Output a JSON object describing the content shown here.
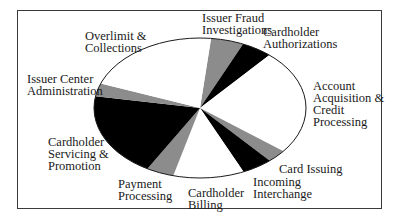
{
  "chart_data": {
    "type": "pie",
    "title": "",
    "style": "elliptical pie, monochrome fills (white / gray / black)",
    "start_angle_deg_clockwise_from_top": 6,
    "slices": [
      {
        "label": "Issuer Fraud Investigations",
        "value": 5.0,
        "fill": "#8c8c8c"
      },
      {
        "label": "Cardholder Authorizations",
        "value": 4.7,
        "fill": "#000000"
      },
      {
        "label": "Account Acquisition & Credit Processing",
        "value": 24.2,
        "fill": "#ffffff"
      },
      {
        "label": "Card Issuing",
        "value": 3.0,
        "fill": "#8c8c8c"
      },
      {
        "label": "Incoming Interchange",
        "value": 4.7,
        "fill": "#000000"
      },
      {
        "label": "Cardholder Billing",
        "value": 10.8,
        "fill": "#ffffff"
      },
      {
        "label": "Payment Processing",
        "value": 4.2,
        "fill": "#8c8c8c"
      },
      {
        "label": "Cardholder Servicing & Promotion",
        "value": 19.4,
        "fill": "#000000"
      },
      {
        "label": "Issuer Center Administration",
        "value": 3.0,
        "fill": "#8c8c8c"
      },
      {
        "label": "Overlimit & Collections",
        "value": 21.0,
        "fill": "#ffffff"
      }
    ],
    "legend": "none (labels placed around pie)",
    "units": "percent (estimated from slice angles)"
  },
  "labels": {
    "overlimit": "Overlimit &\nCollections",
    "fraud": "Issuer Fraud\nInvestigations",
    "auth": "Cardholder\nAuthorizations",
    "account": "Account\nAcquisition &\nCredit\nProcessing",
    "issuer_center": "Issuer Center\nAdministration",
    "servicing": "Cardholder\nServicing &\nPromotion",
    "payment": "Payment\nProcessing",
    "billing": "Cardholder\nBilling",
    "incoming": "Incoming\nInterchange",
    "card_issuing": "Card Issuing"
  }
}
